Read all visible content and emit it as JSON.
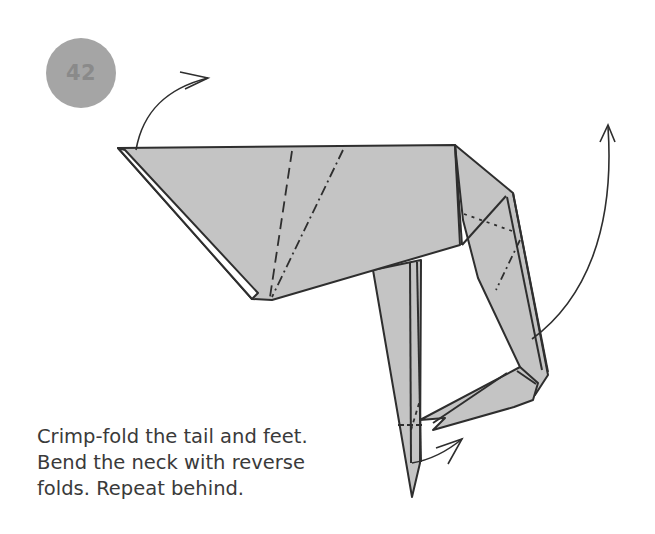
{
  "step": {
    "number": "42"
  },
  "instructions": {
    "lines": [
      "Crimp-fold the tail and feet.",
      "Bend the neck with reverse",
      "folds. Repeat behind."
    ]
  },
  "colors": {
    "paper": "#c4c4c4",
    "line": "#2e2e2e",
    "badge": "#a5a5a5",
    "badge_text": "#8a8a8a",
    "text": "#3a3a3a"
  },
  "diagram": {
    "parts": [
      "body",
      "neck",
      "head",
      "legs/feet",
      "tail"
    ],
    "fold_lines": [
      "valley-fold (dashed)",
      "mountain-fold (dash-dot)"
    ],
    "arrows": [
      "tail crimp arrow",
      "neck lift arrow",
      "feet crimp arrow"
    ]
  }
}
